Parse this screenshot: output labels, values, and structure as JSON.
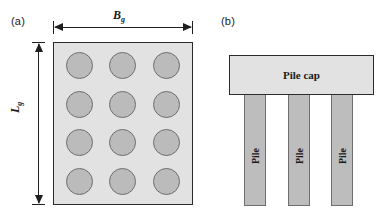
{
  "figure": {
    "panels": [
      {
        "id": "a",
        "label": "(a)",
        "view": "plan",
        "dimensions": {
          "width_symbol": "B",
          "width_subscript": "g",
          "height_symbol": "L",
          "height_subscript": "g"
        },
        "grid": {
          "columns": 3,
          "rows": 4,
          "count": 12,
          "element": "pile-circle"
        },
        "colors": {
          "slab_fill": "#e2e2e2",
          "slab_border": "#2b2b2b",
          "circle_fill": "#bbbbbb",
          "circle_border": "#6e6e6e",
          "arrow": "#1f1f1f"
        }
      },
      {
        "id": "b",
        "label": "(b)",
        "view": "elevation",
        "cap": {
          "label": "Pile cap"
        },
        "piles": [
          {
            "label": "Pile"
          },
          {
            "label": "Pile"
          },
          {
            "label": "Pile"
          }
        ],
        "colors": {
          "cap_fill": "#e2e2e2",
          "cap_border": "#2b2b2b",
          "pile_fill": "#bdbdbd",
          "pile_border": "#6e6e6e"
        }
      }
    ]
  }
}
